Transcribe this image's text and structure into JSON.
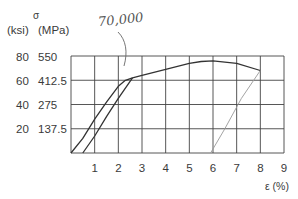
{
  "chart_data": {
    "type": "line",
    "title": "",
    "xlabel": "ε (%)",
    "ylabel_symbol": "σ",
    "ylabel_units_left": "(ksi)",
    "ylabel_units_right": "(MPa)",
    "xlim": [
      0,
      9
    ],
    "ylim": [
      0,
      80
    ],
    "grid": true,
    "x_ticks": [
      "1",
      "2",
      "3",
      "4",
      "5",
      "6",
      "7",
      "8",
      "9"
    ],
    "y_ticks_ksi": [
      "20",
      "40",
      "60",
      "80"
    ],
    "y_ticks_mpa": [
      "137.5",
      "275",
      "412.5",
      "550"
    ],
    "annotation": "70,000",
    "series": [
      {
        "name": "loading curve",
        "x": [
          0,
          0.5,
          1.0,
          1.5,
          2.0,
          2.3,
          2.6,
          3,
          4,
          5,
          5.5,
          6,
          7,
          8
        ],
        "y": [
          0,
          12,
          28,
          42,
          55,
          60,
          62,
          64,
          69,
          74,
          75.5,
          76,
          74,
          68
        ]
      },
      {
        "name": "offset line",
        "x": [
          0.5,
          1.0,
          1.5,
          2.0,
          2.6
        ],
        "y": [
          0,
          14,
          30,
          45,
          62
        ]
      },
      {
        "name": "unloading line",
        "x": [
          5.9,
          6.5,
          7.2,
          8.0
        ],
        "y": [
          0,
          20,
          45,
          68
        ]
      }
    ]
  },
  "labels": {
    "sigma": "σ",
    "ksi": "(ksi)",
    "mpa": "(MPa)",
    "xaxis": "ε (%)",
    "annotation": "70,000"
  }
}
